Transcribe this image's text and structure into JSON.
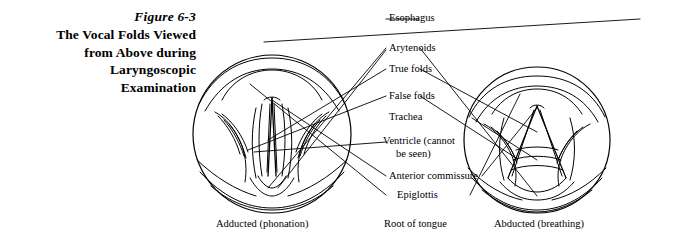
{
  "figure": {
    "number": "Figure 6-3",
    "title_lines": [
      "The Vocal Folds Viewed",
      "from Above during",
      "Laryngoscopic",
      "Examination"
    ],
    "title_full": "The Vocal Folds Viewed from Above during Laryngoscopic Examination"
  },
  "labels": {
    "esophagus": "Esophagus",
    "arytenoids": "Arytenoids",
    "true_folds": "True folds",
    "false_folds": "False folds",
    "trachea": "Trachea",
    "ventricle_line1": "Ventricle (cannot",
    "ventricle_line2": "be seen)",
    "anterior_commissure": "Anterior commissure",
    "epiglottis": "Epiglottis"
  },
  "bottom_labels": {
    "left": "Adducted (phonation)",
    "center": "Root of tongue",
    "right": "Abducted (breathing)"
  },
  "colors": {
    "ink": "#000000",
    "background": "#ffffff"
  },
  "diagram": {
    "type": "anatomical-illustration",
    "views": [
      {
        "name": "left-larynx-view",
        "state": "adducted",
        "caption": "Adducted (phonation)"
      },
      {
        "name": "right-larynx-view",
        "state": "abducted",
        "caption": "Abducted (breathing)"
      }
    ]
  }
}
